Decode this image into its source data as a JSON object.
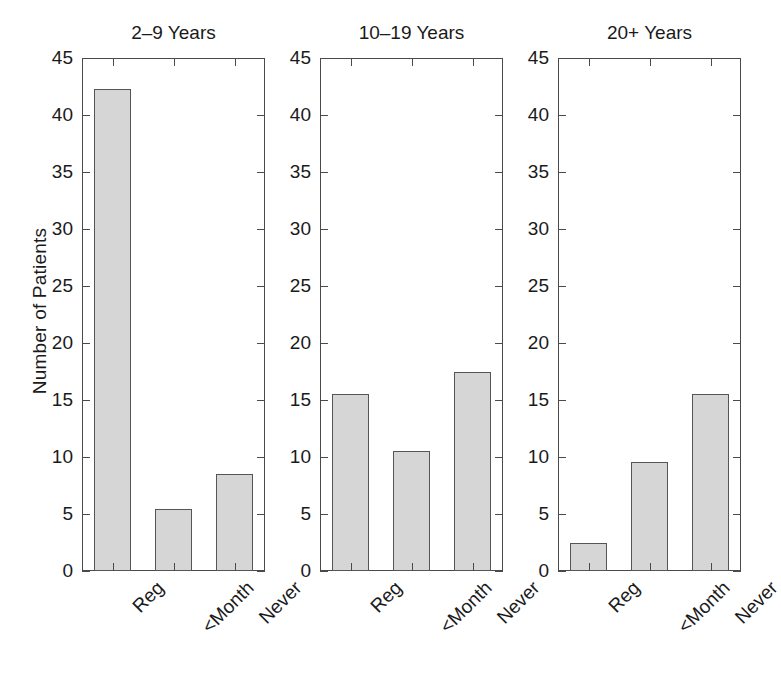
{
  "figure": {
    "ylabel": "Number of Patients",
    "background": "#ffffff",
    "bar_fill": "#d6d6d6",
    "bar_edge": "#555555",
    "axis_color": "#4a4a4a"
  },
  "chart_data": {
    "type": "bar",
    "title": "",
    "xlabel": "",
    "ylabel": "Number of Patients",
    "ylim": [
      0,
      45
    ],
    "yticks": [
      0,
      5,
      10,
      15,
      20,
      25,
      30,
      35,
      40,
      45
    ],
    "ytick_labels": [
      "0",
      "5",
      "10",
      "15",
      "20",
      "25",
      "30",
      "35",
      "40",
      "45"
    ],
    "grid": false,
    "legend": false,
    "categories": [
      "Reg",
      "<Month",
      "Never"
    ],
    "panels": [
      {
        "title": "2–9 Years",
        "categories": [
          "Reg",
          "<Month",
          "Never"
        ],
        "values": [
          42.3,
          5.4,
          8.5
        ]
      },
      {
        "title": "10–19 Years",
        "categories": [
          "Reg",
          "<Month",
          "Never"
        ],
        "values": [
          15.5,
          10.5,
          17.5
        ]
      },
      {
        "title": "20+ Years",
        "categories": [
          "Reg",
          "<Month",
          "Never"
        ],
        "values": [
          2.5,
          9.6,
          15.5
        ]
      }
    ]
  }
}
